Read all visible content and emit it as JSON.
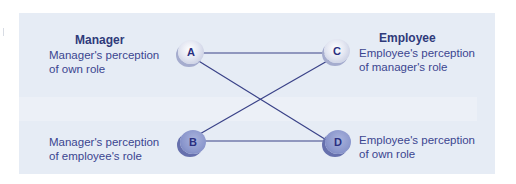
{
  "diagram": {
    "columns": {
      "left_heading": "Manager",
      "right_heading": "Employee"
    },
    "nodes": [
      {
        "id": "A",
        "label": "Manager's perception of own role",
        "label_lines": [
          "Manager's perception",
          "of own role"
        ],
        "style": "light"
      },
      {
        "id": "B",
        "label": "Manager's perception of employee's role",
        "label_lines": [
          "Manager's perception",
          "of employee's role"
        ],
        "style": "dark"
      },
      {
        "id": "C",
        "label": "Employee's perception of manager's role",
        "label_lines": [
          "Employee's perception",
          "of manager's role"
        ],
        "style": "light"
      },
      {
        "id": "D",
        "label": "Employee's perception of own role",
        "label_lines": [
          "Employee's perception",
          "of own role"
        ],
        "style": "dark"
      }
    ],
    "edges": [
      {
        "from": "A",
        "to": "C"
      },
      {
        "from": "A",
        "to": "D"
      },
      {
        "from": "B",
        "to": "C"
      },
      {
        "from": "B",
        "to": "D"
      }
    ],
    "colors": {
      "panel_background": "#e6ecf5",
      "text": "#3b4590",
      "heading": "#2f3a7a",
      "line": "#3a4288",
      "node_light": "#e4e7f2",
      "node_dark": "#8a96cc"
    }
  }
}
